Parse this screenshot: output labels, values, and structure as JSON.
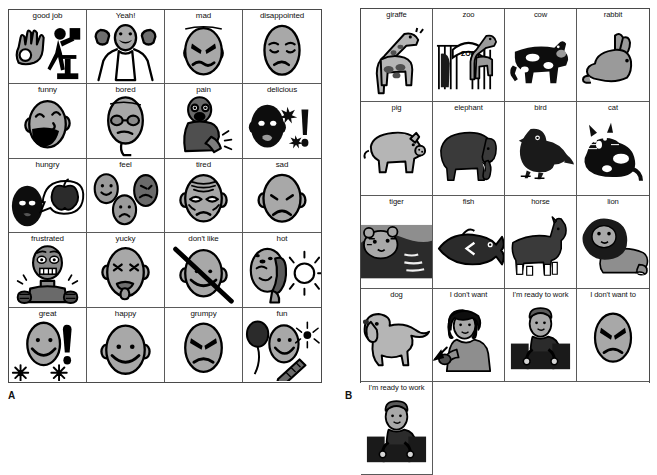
{
  "figure": {
    "panel_a_label": "A",
    "panel_b_label": "B"
  },
  "colors": {
    "ink": "#111111",
    "outline": "#000000",
    "skin_gray": "#a8a8a8",
    "mid_gray": "#808080",
    "dark_gray": "#4d4d4d",
    "black": "#0d0d0d",
    "light_gray": "#cccccc",
    "cell_border": "#5a5a5a",
    "panel_border": "#4a4a4a",
    "page_background": "#ffffff"
  },
  "panel_a": {
    "name": "feelings-and-states-board",
    "columns": 4,
    "rows": 5,
    "cards": [
      {
        "label": "good job",
        "icon": "ok-hand-and-person-at-podium-icon"
      },
      {
        "label": "Yeah!",
        "icon": "cheering-person-icon"
      },
      {
        "label": "mad",
        "icon": "angry-face-icon"
      },
      {
        "label": "disappointed",
        "icon": "disappointed-face-icon"
      },
      {
        "label": "funny",
        "icon": "laughing-face-icon"
      },
      {
        "label": "bored",
        "icon": "bored-face-icon"
      },
      {
        "label": "pain",
        "icon": "person-hurt-arm-icon"
      },
      {
        "label": "delicious",
        "icon": "dark-face-tongue-and-exclamation-icon"
      },
      {
        "label": "hungry",
        "icon": "dark-face-thinking-apple-icon"
      },
      {
        "label": "feel",
        "icon": "three-faces-icon"
      },
      {
        "label": "tired",
        "icon": "tired-face-icon"
      },
      {
        "label": "sad",
        "icon": "sad-face-icon"
      },
      {
        "label": "frustrated",
        "icon": "frustrated-person-fists-icon"
      },
      {
        "label": "yucky",
        "icon": "yucky-face-tongue-out-icon"
      },
      {
        "label": "don't like",
        "icon": "smiling-face-crossed-out-icon"
      },
      {
        "label": "hot",
        "icon": "sweating-face-with-sun-icon"
      },
      {
        "label": "great",
        "icon": "smiling-face-exclamation-sparkles-icon"
      },
      {
        "label": "happy",
        "icon": "happy-face-icon"
      },
      {
        "label": "grumpy",
        "icon": "grumpy-face-icon"
      },
      {
        "label": "fun",
        "icon": "balloon-face-party-horn-icon"
      }
    ]
  },
  "panel_b": {
    "name": "animals-and-phrases-board",
    "columns": 4,
    "rows": 5,
    "cards": [
      {
        "label": "giraffe",
        "icon": "giraffe-icon"
      },
      {
        "label": "zoo",
        "icon": "zoo-gate-icon"
      },
      {
        "label": "cow",
        "icon": "cow-icon"
      },
      {
        "label": "rabbit",
        "icon": "rabbit-icon"
      },
      {
        "label": "pig",
        "icon": "pig-icon"
      },
      {
        "label": "elephant",
        "icon": "elephant-icon"
      },
      {
        "label": "bird",
        "icon": "bird-icon"
      },
      {
        "label": "cat",
        "icon": "cat-icon"
      },
      {
        "label": "tiger",
        "icon": "tiger-icon"
      },
      {
        "label": "fish",
        "icon": "fish-icon"
      },
      {
        "label": "horse",
        "icon": "horse-icon"
      },
      {
        "label": "lion",
        "icon": "lion-icon"
      },
      {
        "label": "dog",
        "icon": "dog-icon"
      },
      {
        "label": "I don't want",
        "icon": "person-pushing-away-icon"
      },
      {
        "label": "I'm ready to work",
        "icon": "person-at-desk-icon"
      },
      {
        "label": "I don't want to",
        "icon": "angry-oval-face-icon"
      },
      {
        "label": "I'm ready to work",
        "icon": "person-at-desk-icon"
      }
    ]
  },
  "zoo_sign_text": "ZOO"
}
